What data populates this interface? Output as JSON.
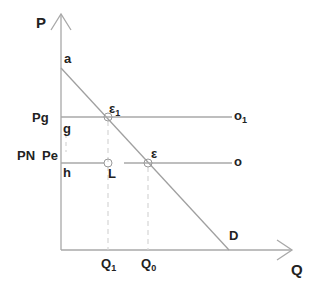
{
  "diagram": {
    "type": "supply-demand price-ceiling diagram",
    "axes": {
      "y_label": "P",
      "x_label": "Q"
    },
    "curves": {
      "demand_label": "D",
      "demand_intercept_label": "a"
    },
    "price_levels": [
      {
        "name": "Pg",
        "axis_point": "g",
        "line_end_label": "o",
        "line_end_sub": "1"
      },
      {
        "name_prefix": "PN",
        "name": "Pe",
        "axis_point": "h",
        "line_end_label": "o",
        "line_end_sub": ""
      }
    ],
    "points": {
      "e1_label": "ε",
      "e1_sub": "1",
      "e_label": "ε",
      "l_label": "L"
    },
    "quantities": [
      {
        "label": "Q",
        "sub": "1"
      },
      {
        "label": "Q",
        "sub": "0"
      }
    ],
    "colors": {
      "line": "#a8a8a8",
      "text": "#222222",
      "dashed": "#d0d0d0"
    }
  }
}
